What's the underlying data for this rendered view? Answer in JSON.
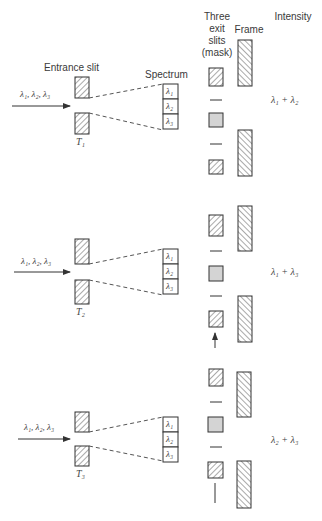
{
  "headers": {
    "entrance_slit": "Entrance slit",
    "spectrum": "Spectrum",
    "exit_slits": "Three\nexit\nslits\n(mask)",
    "frame": "Frame",
    "intensity": "Intensity"
  },
  "input_label": "λ₁, λ₂, λ₃",
  "spectrum_cells": [
    "λ₁",
    "λ₂",
    "λ₃"
  ],
  "panels": [
    {
      "time": "T₁",
      "intensity": "λ₁ + λ₂"
    },
    {
      "time": "T₂",
      "intensity": "λ₁ + λ₃"
    },
    {
      "time": "T₃",
      "intensity": "λ₂ + λ₃"
    }
  ],
  "colors": {
    "line": "#333333",
    "hatch": "#444444",
    "open_slit_fill": "#d4d4d4"
  }
}
